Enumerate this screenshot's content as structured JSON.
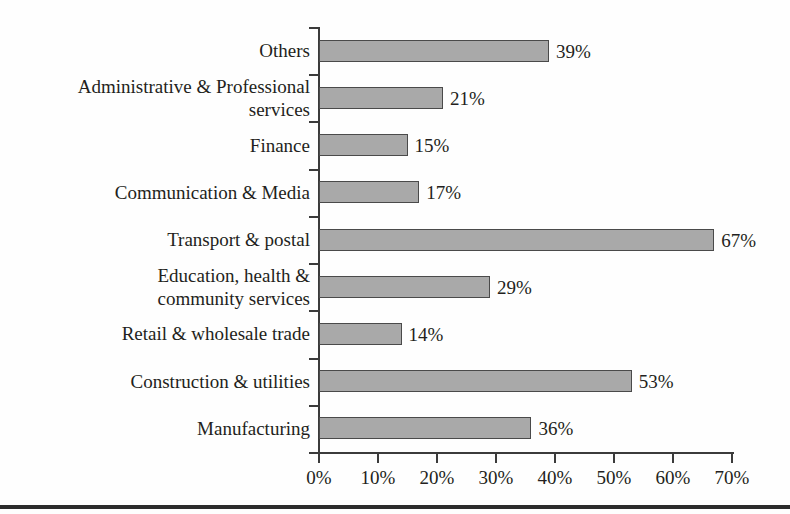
{
  "chart_data": {
    "type": "bar",
    "orientation": "horizontal",
    "title": "",
    "subtitle": "",
    "xlabel": "",
    "ylabel": "",
    "xlim": [
      0,
      70
    ],
    "xtick_labels": [
      "0%",
      "10%",
      "20%",
      "30%",
      "40%",
      "50%",
      "60%",
      "70%"
    ],
    "xticks": [
      0,
      10,
      20,
      30,
      40,
      50,
      60,
      70
    ],
    "grid": false,
    "legend": false,
    "value_suffix": "%",
    "categories": [
      "Others",
      "Administrative & Professional\nservices",
      "Finance",
      "Communication & Media",
      "Transport & postal",
      "Education, health &\ncommunity services",
      "Retail & wholesale trade",
      "Construction & utilities",
      "Manufacturing"
    ],
    "values": [
      39,
      21,
      15,
      17,
      67,
      29,
      14,
      53,
      36
    ],
    "data_labels": [
      "39%",
      "21%",
      "15%",
      "17%",
      "67%",
      "29%",
      "14%",
      "53%",
      "36%"
    ],
    "colors": {
      "bar_fill": "#a9a9a9",
      "bar_edge": "#4a4a4a",
      "axis": "#3b3b3b",
      "text": "#231f20",
      "background": "#fefefe",
      "rule": "#2b2b2b"
    }
  }
}
